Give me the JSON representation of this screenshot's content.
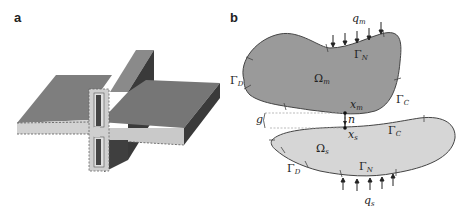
{
  "figure": {
    "panels": [
      {
        "id": "a",
        "label": "a",
        "description": "3D T-joint: horizontal plate intersecting vertical wall with cross-section cut showing hollow profile"
      },
      {
        "id": "b",
        "label": "b",
        "description": "Two-body contact problem schematic"
      }
    ],
    "panel_b": {
      "master_body": {
        "domain_label": "Ω",
        "domain_sub": "m",
        "neumann_label": "Γ",
        "neumann_sub": "N",
        "dirichlet_label": "Γ",
        "dirichlet_sub": "D",
        "contact_label": "Γ",
        "contact_sub": "C",
        "load_label": "q",
        "load_sub": "m",
        "point_label": "x",
        "point_sub": "m",
        "fill": "#9a9a9a"
      },
      "slave_body": {
        "domain_label": "Ω",
        "domain_sub": "s",
        "neumann_label": "Γ",
        "neumann_sub": "N",
        "dirichlet_label": "Γ",
        "dirichlet_sub": "D",
        "contact_label": "Γ",
        "contact_sub": "C",
        "load_label": "q",
        "load_sub": "s",
        "point_label": "x",
        "point_sub": "s",
        "fill": "#d6d6d6"
      },
      "gap_label": "g",
      "normal_label": "n"
    },
    "colors": {
      "plate_top": "#7d7d7d",
      "plate_dark": "#3f3f3f",
      "plate_edge": "#c8c8c8",
      "outline": "#444444"
    }
  }
}
